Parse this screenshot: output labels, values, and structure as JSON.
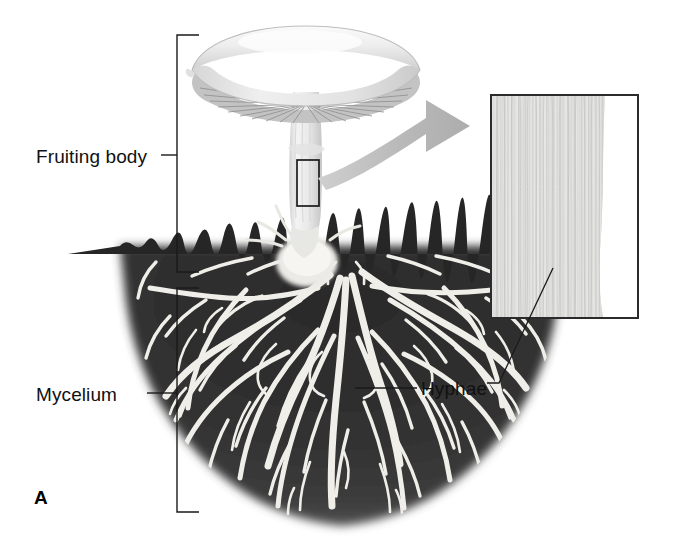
{
  "figure": {
    "panel_letter": "A",
    "style": "grayscale-textbook-illustration"
  },
  "labels": {
    "fruiting_body": "Fruiting body",
    "mycelium": "Mycelium",
    "hyphae": "Hyphae"
  },
  "brackets": [
    {
      "name": "fruiting-body-bracket",
      "label": "Fruiting body",
      "top": 35,
      "bottom": 272,
      "x": 177
    },
    {
      "name": "mycelium-bracket",
      "label": "Mycelium",
      "top": 288,
      "bottom": 512,
      "x": 177
    }
  ],
  "parts": {
    "cap": "mushroom-cap",
    "gills": "mushroom-gills",
    "stem": "mushroom-stem",
    "stem_base": "stem-base-bulb",
    "soil": "soil-mass",
    "hyphal_network": "branching-hyphae-network",
    "marker_box": "magnified-region-marker",
    "arrow": "magnification-arrow",
    "inset": "hyphae-magnified-inset",
    "inset_leader": "inset-leader-line",
    "hyphae_leader": "hyphae-leader-line"
  },
  "colors": {
    "soil_dark": "#262626",
    "soil_mid": "#3a3a3a",
    "hyphae_white": "#f2f0ec",
    "cap_light": "#ebebeb",
    "cap_shadow": "#c9c9c9",
    "gill_gray": "#9a9a9a",
    "arrow_gray": "#b6b6b6",
    "inset_fill": "#e3e3e1",
    "line_black": "#1a1a1a",
    "background": "#ffffff"
  }
}
